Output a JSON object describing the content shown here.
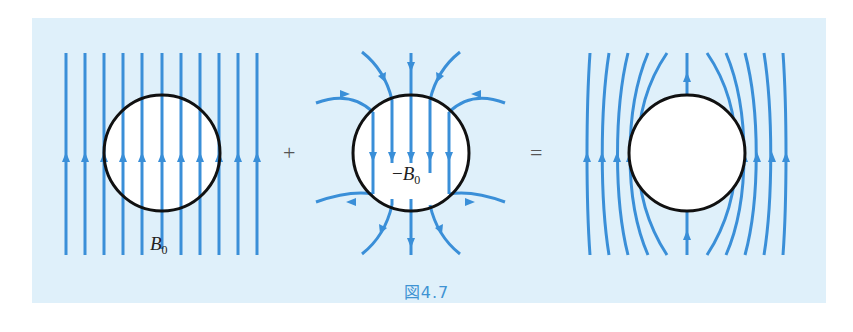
{
  "figure": {
    "caption": "図4.7",
    "background_color": "#dff0fa",
    "line_color": "#3a8fd8",
    "circle_color": "#111111",
    "operators": {
      "plus": "+",
      "equals": "="
    },
    "panels": [
      {
        "id": "uniform-field",
        "label_var": "B",
        "label_sub": "0",
        "label_prefix": "",
        "description": "Uniform upward field B0 passing through sphere"
      },
      {
        "id": "dipole-field",
        "label_var": "B",
        "label_sub": "0",
        "label_prefix": "−",
        "description": "Dipole field with uniform -B0 inside sphere"
      },
      {
        "id": "superposition",
        "description": "Resulting field excluded from sphere"
      }
    ]
  }
}
